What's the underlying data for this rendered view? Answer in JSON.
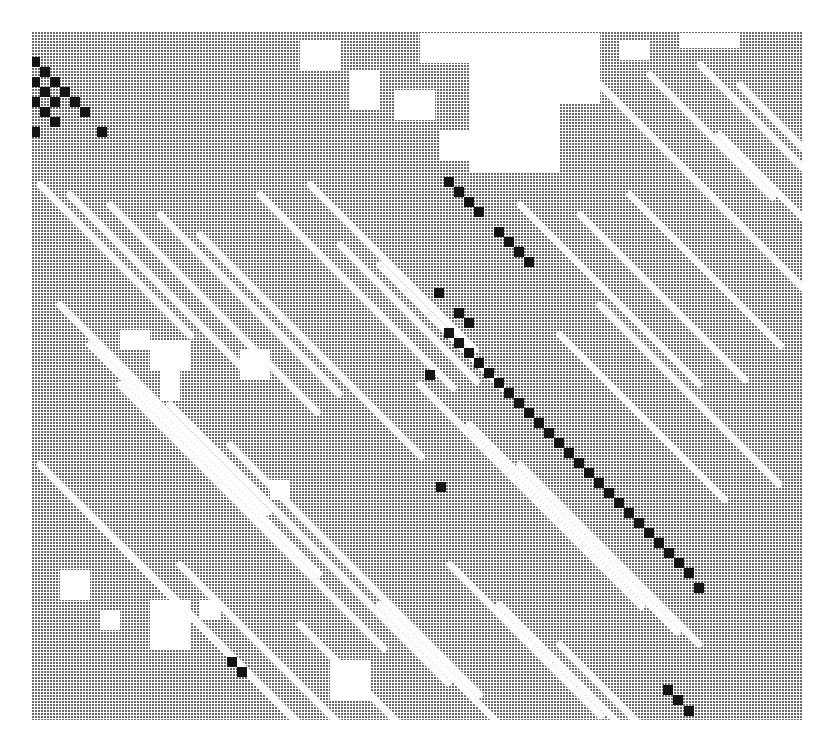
{
  "chart_data": {
    "type": "heatmap",
    "title": "",
    "subtitle": "",
    "xlabel": "",
    "ylabel": "",
    "grid": false,
    "legend": null,
    "cell_pitch_px": 10,
    "plot_bounds_px": {
      "left": 32,
      "top": 32,
      "right": 802,
      "bottom": 720
    },
    "levels": [
      "white (none)",
      "stipple gray (weak)",
      "black (strong)"
    ],
    "colors": {
      "strong": "#141414",
      "weak": "#6a6a6a",
      "none": "#ffffff"
    },
    "strong_cells": [
      [
        35,
        62
      ],
      [
        45,
        72
      ],
      [
        35,
        82
      ],
      [
        55,
        82
      ],
      [
        45,
        92
      ],
      [
        65,
        92
      ],
      [
        35,
        102
      ],
      [
        55,
        102
      ],
      [
        75,
        102
      ],
      [
        45,
        112
      ],
      [
        85,
        112
      ],
      [
        55,
        122
      ],
      [
        35,
        132
      ],
      [
        102,
        132
      ],
      [
        449,
        182
      ],
      [
        459,
        192
      ],
      [
        469,
        202
      ],
      [
        479,
        212
      ],
      [
        499,
        232
      ],
      [
        509,
        242
      ],
      [
        519,
        252
      ],
      [
        529,
        262
      ],
      [
        439,
        293
      ],
      [
        459,
        313
      ],
      [
        469,
        323
      ],
      [
        449,
        333
      ],
      [
        459,
        343
      ],
      [
        469,
        353
      ],
      [
        479,
        363
      ],
      [
        489,
        373
      ],
      [
        499,
        383
      ],
      [
        509,
        393
      ],
      [
        519,
        403
      ],
      [
        529,
        413
      ],
      [
        539,
        423
      ],
      [
        549,
        433
      ],
      [
        559,
        443
      ],
      [
        569,
        453
      ],
      [
        579,
        463
      ],
      [
        589,
        473
      ],
      [
        599,
        483
      ],
      [
        609,
        493
      ],
      [
        619,
        503
      ],
      [
        629,
        513
      ],
      [
        639,
        523
      ],
      [
        649,
        533
      ],
      [
        659,
        543
      ],
      [
        669,
        553
      ],
      [
        679,
        563
      ],
      [
        689,
        573
      ],
      [
        699,
        588
      ],
      [
        430,
        375
      ],
      [
        441,
        487
      ],
      [
        232,
        662
      ],
      [
        242,
        672
      ],
      [
        668,
        690
      ],
      [
        678,
        700
      ],
      [
        689,
        711
      ]
    ],
    "white_regions": [
      [
        470,
        33,
        90,
        140
      ],
      [
        560,
        33,
        40,
        70
      ],
      [
        420,
        33,
        50,
        30
      ],
      [
        620,
        40,
        30,
        20
      ],
      [
        680,
        33,
        60,
        15
      ],
      [
        300,
        40,
        40,
        30
      ],
      [
        350,
        70,
        30,
        40
      ],
      [
        395,
        90,
        40,
        30
      ],
      [
        440,
        130,
        40,
        30
      ],
      [
        150,
        340,
        40,
        30
      ],
      [
        160,
        370,
        20,
        30
      ],
      [
        120,
        330,
        30,
        20
      ],
      [
        240,
        350,
        30,
        30
      ],
      [
        270,
        480,
        20,
        20
      ],
      [
        150,
        600,
        40,
        50
      ],
      [
        330,
        660,
        40,
        40
      ],
      [
        200,
        600,
        20,
        20
      ],
      [
        60,
        570,
        30,
        30
      ],
      [
        100,
        610,
        20,
        20
      ]
    ],
    "white_diagonals": [
      [
        40,
        180,
        220
      ],
      [
        70,
        190,
        260
      ],
      [
        110,
        200,
        300
      ],
      [
        160,
        210,
        260
      ],
      [
        200,
        230,
        320
      ],
      [
        260,
        190,
        280
      ],
      [
        310,
        180,
        240
      ],
      [
        340,
        240,
        200
      ],
      [
        380,
        260,
        180
      ],
      [
        60,
        300,
        300
      ],
      [
        90,
        340,
        330
      ],
      [
        120,
        380,
        380
      ],
      [
        170,
        400,
        400
      ],
      [
        230,
        440,
        360
      ],
      [
        40,
        460,
        300
      ],
      [
        80,
        500,
        320
      ],
      [
        120,
        540,
        300
      ],
      [
        180,
        560,
        260
      ],
      [
        420,
        380,
        320
      ],
      [
        470,
        420,
        300
      ],
      [
        520,
        460,
        260
      ],
      [
        560,
        330,
        240
      ],
      [
        600,
        300,
        260
      ],
      [
        520,
        200,
        260
      ],
      [
        580,
        210,
        240
      ],
      [
        630,
        190,
        220
      ],
      [
        680,
        160,
        200
      ],
      [
        720,
        130,
        180
      ],
      [
        600,
        80,
        200
      ],
      [
        650,
        70,
        180
      ],
      [
        700,
        60,
        160
      ],
      [
        740,
        80,
        140
      ],
      [
        450,
        560,
        220
      ],
      [
        500,
        600,
        200
      ],
      [
        560,
        640,
        160
      ],
      [
        380,
        600,
        200
      ],
      [
        300,
        620,
        160
      ]
    ]
  }
}
